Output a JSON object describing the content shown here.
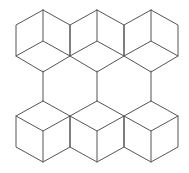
{
  "figure": {
    "stroke_color": "#555555",
    "background": "#ffffff",
    "top_row_cubes": [
      {
        "cx": 43,
        "top": 10
      },
      {
        "cx": 97,
        "top": 10
      },
      {
        "cx": 151,
        "top": 10
      }
    ],
    "bottom_row_cubes": [
      {
        "cx": 43,
        "top": 101
      },
      {
        "cx": 97,
        "top": 101
      },
      {
        "cx": 151,
        "top": 101
      }
    ],
    "connectors": [
      {
        "x": 43,
        "y1": 71,
        "y2": 101
      },
      {
        "x": 97,
        "y1": 71,
        "y2": 101
      },
      {
        "x": 151,
        "y1": 71,
        "y2": 101
      }
    ],
    "cube_half_width": 27,
    "cube_edge_vertical": 31,
    "cube_slope_rise": 15
  }
}
